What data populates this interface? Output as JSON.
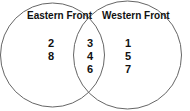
{
  "diagram": {
    "type": "venn",
    "sets": [
      {
        "label": "Eastern Front",
        "only": [
          "2",
          "8"
        ]
      },
      {
        "label": "Western Front",
        "only": [
          "1",
          "5",
          "7"
        ]
      }
    ],
    "intersection": [
      "3",
      "4",
      "6"
    ],
    "stroke_color": "#666666"
  }
}
